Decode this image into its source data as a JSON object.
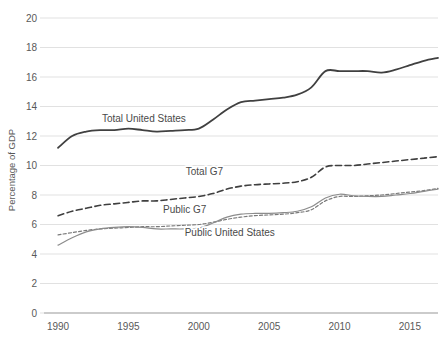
{
  "chart_data": {
    "type": "line",
    "title": "",
    "subtitle": "",
    "xlabel": "",
    "ylabel": "Percentage of GDP",
    "xlim": [
      1989,
      2017
    ],
    "ylim": [
      0,
      20
    ],
    "ytick_labels": [
      "0",
      "2",
      "4",
      "6",
      "8",
      "10",
      "12",
      "14",
      "16",
      "18",
      "20"
    ],
    "yticks": [
      0,
      2,
      4,
      6,
      8,
      10,
      12,
      14,
      16,
      18,
      20
    ],
    "xtick_labels": [
      "1990",
      "1995",
      "2000",
      "2005",
      "2010",
      "2015"
    ],
    "xticks": [
      1990,
      1995,
      2000,
      2005,
      2010,
      2015
    ],
    "grid": "horizontal",
    "legend_position": "inline-annotations",
    "x": [
      1990,
      1991,
      1992,
      1993,
      1994,
      1995,
      1996,
      1997,
      1998,
      1999,
      2000,
      2001,
      2002,
      2003,
      2004,
      2005,
      2006,
      2007,
      2008,
      2009,
      2010,
      2011,
      2012,
      2013,
      2014,
      2015,
      2016,
      2017
    ],
    "series": [
      {
        "name": "Total United States",
        "style": "solid",
        "color": "#404040",
        "width": 1.8,
        "label_x": 1996.1,
        "label_y": 12.95,
        "values": [
          11.2,
          12.0,
          12.3,
          12.4,
          12.4,
          12.5,
          12.4,
          12.3,
          12.35,
          12.4,
          12.5,
          13.1,
          13.8,
          14.3,
          14.4,
          14.5,
          14.6,
          14.8,
          15.3,
          16.4,
          16.4,
          16.4,
          16.4,
          16.3,
          16.5,
          16.8,
          17.1,
          17.3
        ],
        "unit": "% of GDP"
      },
      {
        "name": "Total G7",
        "style": "dashed",
        "color": "#3f3f3f",
        "width": 1.6,
        "label_x": 2000.4,
        "label_y": 9.35,
        "values": [
          6.6,
          6.9,
          7.1,
          7.3,
          7.4,
          7.5,
          7.6,
          7.6,
          7.7,
          7.8,
          7.9,
          8.1,
          8.4,
          8.6,
          8.7,
          8.75,
          8.8,
          8.9,
          9.2,
          9.9,
          10.0,
          10.0,
          10.1,
          10.2,
          10.3,
          10.4,
          10.5,
          10.6
        ],
        "unit": "% of GDP"
      },
      {
        "name": "Public G7",
        "style": "fine-dashed",
        "color": "#7a7a7a",
        "width": 1.2,
        "label_x": 1999.0,
        "label_y": 6.75,
        "values": [
          5.3,
          5.45,
          5.6,
          5.7,
          5.75,
          5.8,
          5.85,
          5.85,
          5.9,
          5.95,
          6.0,
          6.15,
          6.35,
          6.5,
          6.6,
          6.65,
          6.7,
          6.8,
          7.0,
          7.6,
          7.9,
          7.9,
          7.95,
          8.0,
          8.1,
          8.2,
          8.3,
          8.45
        ],
        "unit": "% of GDP"
      },
      {
        "name": "Public United States",
        "style": "solid",
        "color": "#8c8c8c",
        "width": 1.2,
        "label_x": 2002.2,
        "label_y": 5.25,
        "values": [
          4.6,
          5.1,
          5.5,
          5.7,
          5.8,
          5.85,
          5.8,
          5.7,
          5.7,
          5.7,
          5.75,
          6.1,
          6.5,
          6.7,
          6.75,
          6.75,
          6.8,
          6.9,
          7.2,
          7.8,
          8.05,
          7.95,
          7.9,
          7.9,
          8.0,
          8.1,
          8.25,
          8.4
        ],
        "unit": "% of GDP"
      }
    ]
  }
}
